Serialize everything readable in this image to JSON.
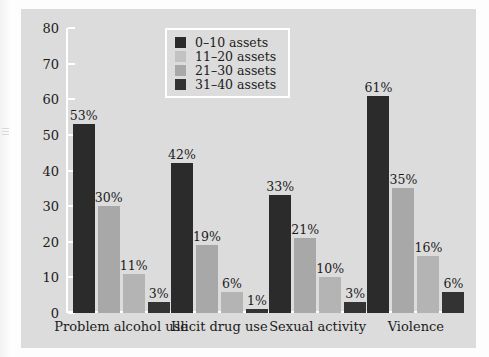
{
  "chart_data": {
    "type": "bar",
    "title": "",
    "xlabel": "",
    "ylabel": "",
    "ylim": [
      0,
      80
    ],
    "ytick_step": 10,
    "yticks": [
      0,
      10,
      20,
      30,
      40,
      50,
      60,
      70,
      80
    ],
    "ytick_labels": [
      "0",
      "10",
      "20",
      "30",
      "40",
      "50",
      "60",
      "70",
      "80"
    ],
    "grid": false,
    "legend_position": "top-center",
    "categories": [
      "Problem alcohol use",
      "Illicit drug use",
      "Sexual activity",
      "Violence"
    ],
    "series": [
      {
        "name": "0–10 assets",
        "color": "#2b2b2b",
        "values": [
          53,
          42,
          33,
          61
        ],
        "labels": [
          "53%",
          "42%",
          "33%",
          "61%"
        ]
      },
      {
        "name": "11–20 assets",
        "color": "#a8a8a8",
        "values": [
          30,
          19,
          21,
          35
        ],
        "labels": [
          "30%",
          "19%",
          "21%",
          "35%"
        ]
      },
      {
        "name": "21–30 assets",
        "color": "#b4b4b4",
        "values": [
          11,
          6,
          10,
          16
        ],
        "labels": [
          "11%",
          "6%",
          "10%",
          "16%"
        ]
      },
      {
        "name": "31–40 assets",
        "color": "#333333",
        "values": [
          3,
          1,
          3,
          6
        ],
        "labels": [
          "3%",
          "1%",
          "3%",
          "6%"
        ]
      }
    ]
  },
  "legend": {
    "items": [
      {
        "label": "0–10 assets",
        "color": "#2b2b2b"
      },
      {
        "label": "11–20 assets",
        "color": "#c2c2c2"
      },
      {
        "label": "21–30 assets",
        "color": "#a8a8a8"
      },
      {
        "label": "31–40 assets",
        "color": "#333333"
      }
    ]
  },
  "colors": {
    "panel_background": "#dcdcdc",
    "figure_background": "#fdfdfd",
    "axis": "#ffffff",
    "text": "#1b1b1b"
  }
}
